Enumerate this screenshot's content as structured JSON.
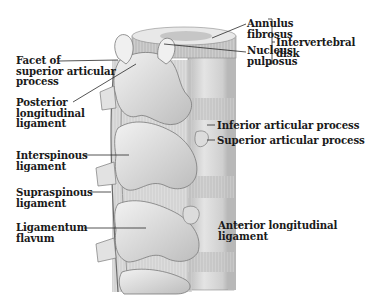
{
  "figure": {
    "colors": {
      "background": "#ffffff",
      "bone": "#e6e6e6",
      "bone_shadow": "#a9a9a9",
      "ligament": "#c9c9c9",
      "outline": "#6f6f6f",
      "leader_line": "#2a2a2a",
      "label_text": "#1a1a1a"
    }
  },
  "labels": {
    "annulus_fibrosus": {
      "lines": [
        "Annulus",
        "fibrosus"
      ]
    },
    "nucleus_pulposus": {
      "lines": [
        "Nucleus",
        "pulposus"
      ]
    },
    "intervertebral_disk": {
      "lines": [
        "Intervertebral",
        "disk"
      ]
    },
    "facet_superior_articular": {
      "lines": [
        "Facet of",
        "superior articular",
        "process"
      ]
    },
    "posterior_longitudinal_ligament": {
      "lines": [
        "Posterior",
        "longitudinal",
        "ligament"
      ]
    },
    "inferior_articular_process": {
      "lines": [
        "Inferior articular process"
      ]
    },
    "superior_articular_process": {
      "lines": [
        "Superior articular process"
      ]
    },
    "interspinous_ligament": {
      "lines": [
        "Interspinous",
        "ligament"
      ]
    },
    "supraspinous_ligament": {
      "lines": [
        "Supraspinous",
        "ligament"
      ]
    },
    "ligamentum_flavum": {
      "lines": [
        "Ligamentum",
        "flavum"
      ]
    },
    "anterior_longitudinal_ligament": {
      "lines": [
        "Anterior longitudinal",
        "ligament"
      ]
    }
  }
}
